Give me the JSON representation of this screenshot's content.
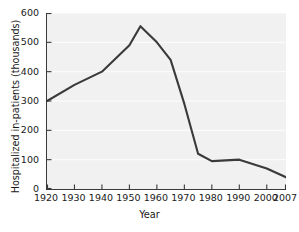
{
  "chart_data": {
    "type": "line",
    "title": "",
    "xlabel": "Year",
    "ylabel": "Hospitalized in-patients (thousands)",
    "xlim": [
      1920,
      2007
    ],
    "ylim": [
      0,
      600
    ],
    "grid": true,
    "grid_orientation": "horizontal",
    "legend": "none",
    "line_color": "#3a3a3a",
    "background_color": "#f1f1f1",
    "axis_color": "#3a3a3a",
    "x_ticks": [
      1920,
      1930,
      1940,
      1950,
      1960,
      1970,
      1980,
      1990,
      2000,
      2007
    ],
    "x_tick_labels": [
      "1920",
      "1930",
      "1940",
      "1950",
      "1960",
      "1970",
      "1980",
      "1990",
      "2000",
      "2007"
    ],
    "y_ticks": [
      0,
      100,
      200,
      300,
      400,
      500,
      600
    ],
    "y_tick_labels": [
      "0",
      "100",
      "200",
      "300",
      "400",
      "500",
      "600"
    ],
    "x": [
      1920,
      1930,
      1940,
      1950,
      1954,
      1960,
      1965,
      1970,
      1975,
      1980,
      1990,
      2000,
      2007
    ],
    "values": [
      300,
      355,
      400,
      490,
      555,
      500,
      440,
      290,
      120,
      95,
      100,
      70,
      40
    ],
    "series": [
      {
        "name": "Hospitalized in-patients",
        "points": [
          {
            "x": 1920,
            "y": 300
          },
          {
            "x": 1930,
            "y": 355
          },
          {
            "x": 1940,
            "y": 400
          },
          {
            "x": 1950,
            "y": 490
          },
          {
            "x": 1954,
            "y": 555
          },
          {
            "x": 1960,
            "y": 500
          },
          {
            "x": 1965,
            "y": 440
          },
          {
            "x": 1970,
            "y": 290
          },
          {
            "x": 1975,
            "y": 120
          },
          {
            "x": 1980,
            "y": 95
          },
          {
            "x": 1990,
            "y": 100
          },
          {
            "x": 2000,
            "y": 70
          },
          {
            "x": 2007,
            "y": 40
          }
        ]
      }
    ]
  }
}
